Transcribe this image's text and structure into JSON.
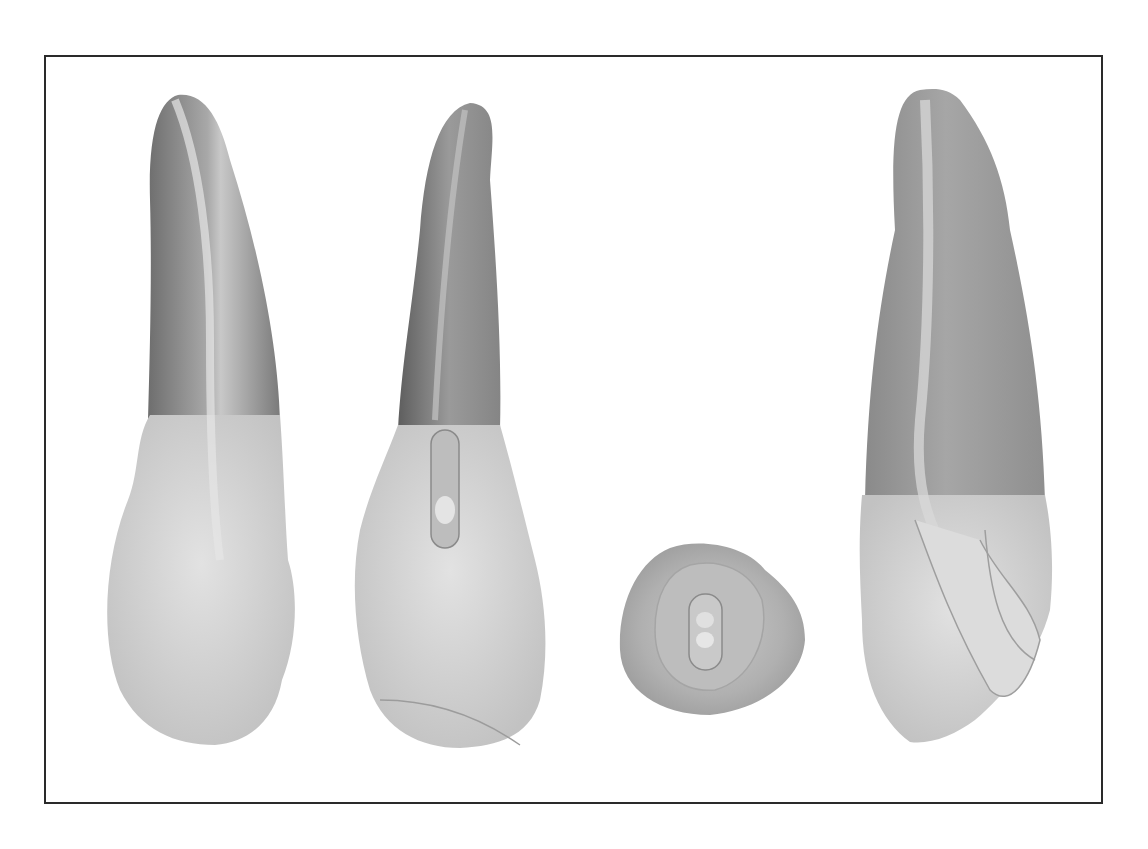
{
  "figure": {
    "frame_color": "#2a2a2a",
    "background": "#ffffff",
    "views": [
      {
        "id": "view-1",
        "name": "labial-view",
        "root_color": "#8c8c8c",
        "crown_color": "#d2d2d2"
      },
      {
        "id": "view-2",
        "name": "lingual-view-with-access",
        "root_color": "#7a7a7a",
        "crown_color": "#d0d0d0",
        "access_color": "#bdbdbd"
      },
      {
        "id": "view-3",
        "name": "incisal-occlusal-view",
        "outline_color": "#b8b8b8",
        "access_color": "#c4c4c4"
      },
      {
        "id": "view-4",
        "name": "proximal-section-view",
        "root_color": "#999999",
        "crown_color": "#d6d6d6"
      }
    ]
  }
}
